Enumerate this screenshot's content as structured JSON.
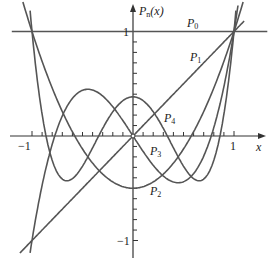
{
  "chart_data": {
    "type": "line",
    "title": "",
    "xlabel": "x",
    "ylabel": "P_n(x)",
    "xlim": [
      -1.03,
      1.3
    ],
    "ylim": [
      -1.2,
      1.3
    ],
    "grid": false,
    "legend": "inline labels",
    "x_ticks": [
      "-1",
      "1"
    ],
    "y_ticks": [
      "1",
      "-1"
    ],
    "tick_step": 0.1,
    "series": [
      {
        "name": "P0",
        "label": "P",
        "sub": "0",
        "formula": "1"
      },
      {
        "name": "P1",
        "label": "P",
        "sub": "1",
        "formula": "x"
      },
      {
        "name": "P2",
        "label": "P",
        "sub": "2",
        "formula": "(3x^2-1)/2"
      },
      {
        "name": "P3",
        "label": "P",
        "sub": "3",
        "formula": "(5x^3-3x)/2"
      },
      {
        "name": "P4",
        "label": "P",
        "sub": "4",
        "formula": "(35x^4-30x^2+3)/8"
      }
    ],
    "sample_points": {
      "x": [
        -1,
        -0.5,
        0,
        0.5,
        1
      ],
      "P0": [
        1,
        1,
        1,
        1,
        1
      ],
      "P1": [
        -1,
        -0.5,
        0,
        0.5,
        1
      ],
      "P2": [
        1,
        -0.125,
        -0.5,
        -0.125,
        1
      ],
      "P3": [
        -1,
        0.4375,
        0,
        -0.4375,
        1
      ],
      "P4": [
        1,
        -0.2891,
        0.375,
        -0.2891,
        1
      ]
    }
  },
  "labels": {
    "yaxis": {
      "main": "P",
      "sub": "n",
      "rest": "(x)"
    },
    "x": "x",
    "xtick_neg": "−1",
    "xtick_pos": "1",
    "ytick_pos": "1",
    "ytick_neg": "−1",
    "p0": {
      "main": "P",
      "sub": "0"
    },
    "p1": {
      "main": "P",
      "sub": "1"
    },
    "p2": {
      "main": "P",
      "sub": "2"
    },
    "p3": {
      "main": "P",
      "sub": "3"
    },
    "p4": {
      "main": "P",
      "sub": "4"
    }
  },
  "colors": {
    "curve": "#555555",
    "axis": "#333333"
  }
}
